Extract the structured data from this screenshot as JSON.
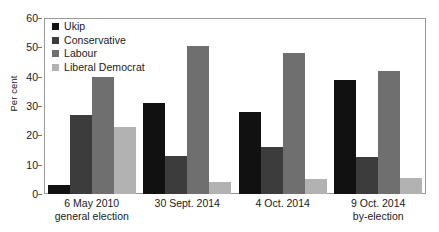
{
  "chart_data": {
    "type": "bar",
    "title": "",
    "xlabel": "",
    "ylabel": "Per cent",
    "ylim": [
      0,
      60
    ],
    "yticks": [
      0,
      10,
      20,
      30,
      40,
      50,
      60
    ],
    "grid": false,
    "legend_position": "top-left",
    "categories": [
      "6 May 2010 general election",
      "30 Sept. 2014",
      "4 Oct. 2014",
      "9 Oct. 2014 by-election"
    ],
    "category_lines": [
      {
        "line1": "6 May 2010",
        "line2": "general election"
      },
      {
        "line1": "30 Sept. 2014",
        "line2": ""
      },
      {
        "line1": "4 Oct. 2014",
        "line2": ""
      },
      {
        "line1": "9 Oct. 2014",
        "line2": "by-election"
      }
    ],
    "series": [
      {
        "name": "Ukip",
        "color": "#111111",
        "values": [
          3,
          31,
          28,
          39
        ]
      },
      {
        "name": "Conservative",
        "color": "#3c3c3c",
        "values": [
          27,
          13,
          16,
          12.5
        ]
      },
      {
        "name": "Labour",
        "color": "#6f6f6f",
        "values": [
          40,
          50.5,
          48,
          42
        ]
      },
      {
        "name": "Liberal Democrat",
        "color": "#b2b2b2",
        "values": [
          23,
          4,
          5,
          5.5
        ]
      }
    ]
  },
  "axis": {
    "y_title": "Per cent",
    "y_tick_labels": [
      "60",
      "50",
      "40",
      "30",
      "20",
      "10",
      "0"
    ]
  }
}
